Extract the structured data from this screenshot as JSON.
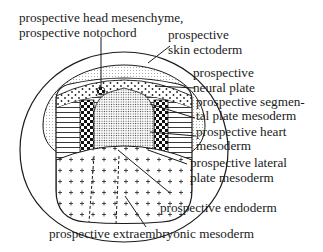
{
  "diagram": {
    "type": "embryo fate map",
    "labels": {
      "head_mesenchyme_l1": "prospective head mesenchyme,",
      "head_mesenchyme_l2": "prospective notochord",
      "skin_ectoderm_l1": "prospective",
      "skin_ectoderm_l2": "skin ectoderm",
      "neural_plate_l1": "prospective",
      "neural_plate_l2": "neural plate",
      "segmental_plate_l1": "prospective segmen-",
      "segmental_plate_l2": "tal plate mesoderm",
      "heart_l1": "prospective heart",
      "heart_l2": "mesoderm",
      "lateral_plate_l1": "prospective lateral",
      "lateral_plate_l2": "plate mesoderm",
      "endoderm": "prospective endoderm",
      "extraembryonic": "prospective extraembryonic mesoderm"
    },
    "colors": {
      "line": "#1a1a1a",
      "background": "#ffffff"
    }
  }
}
